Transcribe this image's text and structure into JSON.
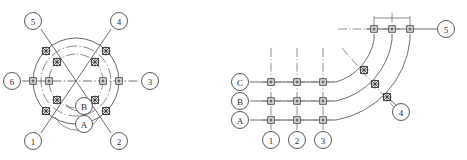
{
  "figure": {
    "background_color": "#ffffff",
    "line_color": "#3a3a3a",
    "marker_color": "#2b2b2b",
    "panels": [
      {
        "name": "radial-panel",
        "description": "Circular radial axis grid with six radial axes and two concentric circles",
        "center": {
          "x": 76,
          "y": 81
        },
        "circles": [
          {
            "name": "outer-circle",
            "radius": 43,
            "style": "solid"
          },
          {
            "name": "inner-circle",
            "radius": 27,
            "style": "dash-dot"
          },
          {
            "name": "mid-arc-circle",
            "radius": 35,
            "style": "dash-dot"
          }
        ],
        "axis_labels": [
          {
            "id": "1",
            "text": "1",
            "x": 33,
            "y": 141
          },
          {
            "id": "2",
            "text": "2",
            "x": 119,
            "y": 141
          },
          {
            "id": "3",
            "text": "3",
            "x": 150,
            "y": 81
          },
          {
            "id": "4",
            "text": "4",
            "x": 119,
            "y": 21
          },
          {
            "id": "5",
            "text": "5",
            "x": 33,
            "y": 21
          },
          {
            "id": "6",
            "text": "6",
            "x": 12,
            "y": 81
          }
        ],
        "ring_labels": [
          {
            "id": "A",
            "text": "A",
            "x": 84,
            "y": 124
          },
          {
            "id": "B",
            "text": "B",
            "x": 84,
            "y": 106
          }
        ],
        "cross_markers": [
          {
            "name": "marker-axis5-outer",
            "x": 46,
            "y": 51
          },
          {
            "name": "marker-axis4-outer",
            "x": 106,
            "y": 51
          },
          {
            "name": "marker-axis5-inner",
            "x": 57,
            "y": 62
          },
          {
            "name": "marker-axis4-inner",
            "x": 95,
            "y": 62
          },
          {
            "name": "marker-axis1-inner",
            "x": 57,
            "y": 100
          },
          {
            "name": "marker-axis2-inner",
            "x": 95,
            "y": 100
          },
          {
            "name": "marker-axis1-outer",
            "x": 46,
            "y": 111
          },
          {
            "name": "marker-axis2-outer",
            "x": 106,
            "y": 111
          }
        ],
        "square_markers": [
          {
            "name": "marker-axis6-outer",
            "x": 33,
            "y": 81
          },
          {
            "name": "marker-axis6-inner",
            "x": 49,
            "y": 81
          },
          {
            "name": "marker-axis3-inner",
            "x": 103,
            "y": 81
          },
          {
            "name": "marker-axis3-outer",
            "x": 119,
            "y": 81
          }
        ]
      },
      {
        "name": "orthogonal-panel",
        "description": "Orthogonal grid with rows A,B,C and columns 1,2,3 transitioning through quarter arcs to top axis 5",
        "rows": [
          {
            "id": "A",
            "text": "A",
            "label_x": 240,
            "y": 120
          },
          {
            "id": "B",
            "text": "B",
            "label_x": 240,
            "y": 101
          },
          {
            "id": "C",
            "text": "C",
            "label_x": 240,
            "y": 82
          }
        ],
        "columns": [
          {
            "id": "1",
            "text": "1",
            "x": 271,
            "label_y": 140
          },
          {
            "id": "2",
            "text": "2",
            "x": 297,
            "label_y": 140
          },
          {
            "id": "3",
            "text": "3",
            "x": 323,
            "label_y": 140
          }
        ],
        "top_axis_label": {
          "id": "5",
          "text": "5",
          "x": 446,
          "y": 29
        },
        "corner_label": {
          "id": "4",
          "text": "4",
          "x": 401,
          "y": 112
        },
        "top_axis_y": 29,
        "top_square_markers": [
          {
            "name": "marker-top-col-a",
            "x": 374,
            "y": 29
          },
          {
            "name": "marker-top-col-b",
            "x": 392,
            "y": 29
          },
          {
            "name": "marker-top-col-c",
            "x": 410,
            "y": 29
          }
        ],
        "grid_square_markers": [
          {
            "name": "marker-c1",
            "x": 271,
            "y": 82
          },
          {
            "name": "marker-c2",
            "x": 297,
            "y": 82
          },
          {
            "name": "marker-c3",
            "x": 323,
            "y": 82
          },
          {
            "name": "marker-b1",
            "x": 271,
            "y": 101
          },
          {
            "name": "marker-b2",
            "x": 297,
            "y": 101
          },
          {
            "name": "marker-b3",
            "x": 323,
            "y": 101
          },
          {
            "name": "marker-a1",
            "x": 271,
            "y": 120
          },
          {
            "name": "marker-a2",
            "x": 297,
            "y": 120
          },
          {
            "name": "marker-a3",
            "x": 323,
            "y": 120
          }
        ],
        "arc_cross_markers": [
          {
            "name": "marker-arc-c",
            "x": 364,
            "y": 70
          },
          {
            "name": "marker-arc-b",
            "x": 375,
            "y": 84
          },
          {
            "name": "marker-arc-a",
            "x": 387,
            "y": 97
          }
        ],
        "dimension": {
          "name": "top-dimension",
          "text": "t",
          "x1": 374,
          "x2": 410,
          "y": 18,
          "label_x": 392,
          "label_y": 15
        }
      }
    ]
  }
}
